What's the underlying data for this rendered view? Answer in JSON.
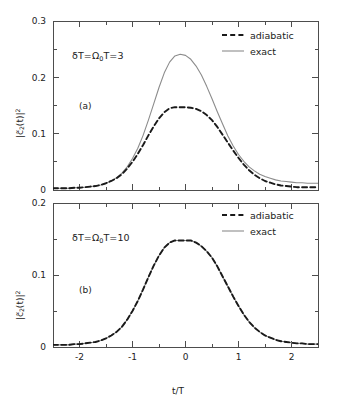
{
  "figure": {
    "background": "#ffffff",
    "width": 341,
    "height": 406,
    "xlabel": "t/T",
    "ylabel_parts": {
      "pre": "|c",
      "tilde": "~",
      "sub": "2",
      "mid": "(t)|",
      "sup": "2"
    },
    "ylabel_plain": "|c2(t)|^2"
  },
  "style": {
    "exact_color": "#8c8c8c",
    "adiabatic_color": "#1a1a1a",
    "axis_color": "#4d4d4d",
    "text_color": "#222222"
  },
  "legend": {
    "adiabatic_label": "adiabatic",
    "exact_label": "exact"
  },
  "panel_a": {
    "tag": "(a)",
    "annotation_parts": {
      "delta": "δT=",
      "omega": "Ω",
      "sub": "0",
      "post": "T=3"
    },
    "annotation_plain": "δT=Ω₀T=3"
  },
  "panel_b": {
    "tag": "(b)",
    "annotation_parts": {
      "delta": "δT=",
      "omega": "Ω",
      "sub": "0",
      "post": "T=10"
    },
    "annotation_plain": "δT=Ω₀T=10"
  },
  "chart_data": [
    {
      "type": "line",
      "panel": "a",
      "title": "",
      "xlabel": "",
      "ylabel": "|c2(t)|^2",
      "xlim": [
        -2.5,
        2.5
      ],
      "ylim": [
        0.0,
        0.3
      ],
      "xticks": [
        -2,
        -1,
        0,
        1,
        2
      ],
      "xticklabels": [
        "-2",
        "-1",
        "0",
        "1",
        "2"
      ],
      "xminor_step": 0.5,
      "yticks": [
        0,
        0.1,
        0.2,
        0.3
      ],
      "yticklabels": [
        "0",
        "0.1",
        "0.2",
        "0.3"
      ],
      "yminor_step": 0.05,
      "grid": false,
      "legend_position": "top-right",
      "annotation": "δT=Ω₀T=3",
      "panel_tag": "(a)",
      "x": [
        -2.5,
        -2.4,
        -2.3,
        -2.2,
        -2.1,
        -2.0,
        -1.9,
        -1.8,
        -1.7,
        -1.6,
        -1.5,
        -1.4,
        -1.3,
        -1.2,
        -1.1,
        -1.0,
        -0.9,
        -0.8,
        -0.7,
        -0.6,
        -0.5,
        -0.4,
        -0.3,
        -0.2,
        -0.1,
        0.0,
        0.1,
        0.2,
        0.3,
        0.4,
        0.5,
        0.6,
        0.7,
        0.8,
        0.9,
        1.0,
        1.1,
        1.2,
        1.3,
        1.4,
        1.5,
        1.6,
        1.7,
        1.8,
        1.9,
        2.0,
        2.1,
        2.2,
        2.3,
        2.4,
        2.5
      ],
      "series": [
        {
          "name": "adiabatic",
          "style": "dashed",
          "color": "#1a1a1a",
          "values": [
            0.003,
            0.003,
            0.003,
            0.003,
            0.004,
            0.004,
            0.005,
            0.006,
            0.007,
            0.009,
            0.012,
            0.016,
            0.021,
            0.028,
            0.038,
            0.05,
            0.064,
            0.08,
            0.097,
            0.113,
            0.127,
            0.138,
            0.145,
            0.147,
            0.147,
            0.147,
            0.146,
            0.144,
            0.14,
            0.133,
            0.124,
            0.112,
            0.098,
            0.084,
            0.07,
            0.057,
            0.045,
            0.035,
            0.027,
            0.021,
            0.016,
            0.013,
            0.01,
            0.008,
            0.007,
            0.006,
            0.005,
            0.005,
            0.005,
            0.005,
            0.005
          ]
        },
        {
          "name": "exact",
          "style": "solid",
          "color": "#8c8c8c",
          "values": [
            0.003,
            0.003,
            0.003,
            0.003,
            0.004,
            0.004,
            0.005,
            0.006,
            0.007,
            0.009,
            0.012,
            0.016,
            0.022,
            0.03,
            0.041,
            0.056,
            0.074,
            0.097,
            0.124,
            0.153,
            0.182,
            0.208,
            0.227,
            0.238,
            0.241,
            0.239,
            0.232,
            0.22,
            0.204,
            0.184,
            0.162,
            0.139,
            0.117,
            0.096,
            0.078,
            0.063,
            0.051,
            0.041,
            0.034,
            0.028,
            0.024,
            0.021,
            0.018,
            0.016,
            0.015,
            0.014,
            0.013,
            0.013,
            0.012,
            0.012,
            0.012
          ]
        }
      ]
    },
    {
      "type": "line",
      "panel": "b",
      "title": "",
      "xlabel": "t/T",
      "ylabel": "|c2(t)|^2",
      "xlim": [
        -2.5,
        2.5
      ],
      "ylim": [
        0.0,
        0.2
      ],
      "xticks": [
        -2,
        -1,
        0,
        1,
        2
      ],
      "xticklabels": [
        "-2",
        "-1",
        "0",
        "1",
        "2"
      ],
      "xminor_step": 0.5,
      "yticks": [
        0,
        0.1,
        0.2
      ],
      "yticklabels": [
        "0",
        "0.1",
        "0.2"
      ],
      "yminor_step": 0.05,
      "grid": false,
      "legend_position": "top-right",
      "annotation": "δT=Ω₀T=10",
      "panel_tag": "(b)",
      "x": [
        -2.5,
        -2.4,
        -2.3,
        -2.2,
        -2.1,
        -2.0,
        -1.9,
        -1.8,
        -1.7,
        -1.6,
        -1.5,
        -1.4,
        -1.3,
        -1.2,
        -1.1,
        -1.0,
        -0.9,
        -0.8,
        -0.7,
        -0.6,
        -0.5,
        -0.4,
        -0.3,
        -0.2,
        -0.1,
        0.0,
        0.1,
        0.2,
        0.3,
        0.4,
        0.5,
        0.6,
        0.7,
        0.8,
        0.9,
        1.0,
        1.1,
        1.2,
        1.3,
        1.4,
        1.5,
        1.6,
        1.7,
        1.8,
        1.9,
        2.0,
        2.1,
        2.2,
        2.3,
        2.4,
        2.5
      ],
      "series": [
        {
          "name": "adiabatic",
          "style": "dashed",
          "color": "#1a1a1a",
          "values": [
            0.003,
            0.003,
            0.003,
            0.003,
            0.004,
            0.004,
            0.005,
            0.006,
            0.007,
            0.009,
            0.012,
            0.016,
            0.021,
            0.028,
            0.038,
            0.05,
            0.064,
            0.08,
            0.097,
            0.113,
            0.127,
            0.138,
            0.145,
            0.148,
            0.148,
            0.148,
            0.148,
            0.145,
            0.14,
            0.133,
            0.124,
            0.112,
            0.098,
            0.084,
            0.07,
            0.057,
            0.045,
            0.035,
            0.027,
            0.021,
            0.016,
            0.013,
            0.01,
            0.008,
            0.007,
            0.006,
            0.005,
            0.005,
            0.004,
            0.004,
            0.004
          ]
        },
        {
          "name": "exact",
          "style": "solid",
          "color": "#8c8c8c",
          "values": [
            0.003,
            0.003,
            0.003,
            0.003,
            0.004,
            0.004,
            0.005,
            0.006,
            0.007,
            0.009,
            0.012,
            0.016,
            0.021,
            0.028,
            0.038,
            0.05,
            0.064,
            0.08,
            0.097,
            0.113,
            0.127,
            0.138,
            0.145,
            0.148,
            0.148,
            0.148,
            0.148,
            0.145,
            0.14,
            0.133,
            0.124,
            0.112,
            0.098,
            0.084,
            0.07,
            0.057,
            0.045,
            0.035,
            0.027,
            0.021,
            0.016,
            0.013,
            0.01,
            0.008,
            0.007,
            0.006,
            0.005,
            0.005,
            0.004,
            0.004,
            0.004
          ]
        }
      ]
    }
  ]
}
